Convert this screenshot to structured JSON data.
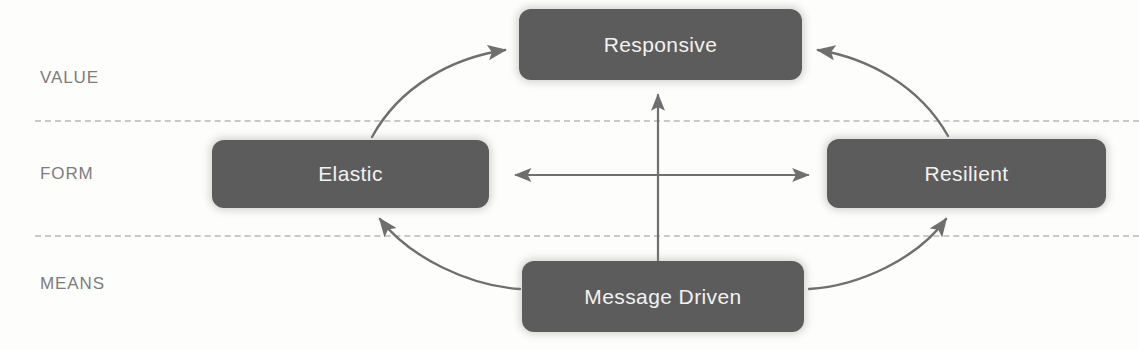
{
  "diagram": {
    "colors": {
      "node_fill": "#5c5c5c",
      "node_text": "#f2f2f2",
      "band_label": "#7c7c7c",
      "divider": "#c9c9c9",
      "arrow": "#6f6f6f",
      "background": "#fdfdfc"
    },
    "bands": [
      {
        "id": "value",
        "label": "VALUE"
      },
      {
        "id": "form",
        "label": "FORM"
      },
      {
        "id": "means",
        "label": "MEANS"
      }
    ],
    "nodes": [
      {
        "id": "responsive",
        "label": "Responsive",
        "band": "value"
      },
      {
        "id": "elastic",
        "label": "Elastic",
        "band": "form"
      },
      {
        "id": "resilient",
        "label": "Resilient",
        "band": "form"
      },
      {
        "id": "message",
        "label": "Message Driven",
        "band": "means"
      }
    ],
    "connections": [
      {
        "id": "elastic-to-responsive",
        "from": "elastic",
        "to": "responsive",
        "style": "curved",
        "arrowheads": "single"
      },
      {
        "id": "resilient-to-responsive",
        "from": "resilient",
        "to": "responsive",
        "style": "curved",
        "arrowheads": "single"
      },
      {
        "id": "message-to-elastic",
        "from": "message",
        "to": "elastic",
        "style": "curved",
        "arrowheads": "single"
      },
      {
        "id": "message-to-resilient",
        "from": "message",
        "to": "resilient",
        "style": "curved",
        "arrowheads": "single"
      },
      {
        "id": "elastic-resilient-axis",
        "from": "elastic",
        "to": "resilient",
        "style": "straight",
        "arrowheads": "double"
      },
      {
        "id": "message-to-responsive-axis",
        "from": "message",
        "to": "responsive",
        "style": "straight",
        "arrowheads": "single"
      }
    ]
  }
}
